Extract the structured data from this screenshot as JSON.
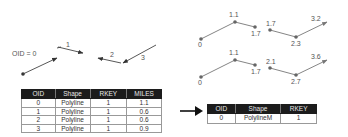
{
  "left_figure": {
    "oid_label": "OID = 0",
    "segment_labels": [
      "1",
      "2",
      "3"
    ]
  },
  "right_figure": {
    "top_line": {
      "measures": [
        "0",
        "1.1",
        "1.7",
        "1.7",
        "2.3",
        "3.2"
      ]
    },
    "bottom_line": {
      "measures": [
        "0",
        "1.1",
        "1.7",
        "2.1",
        "2.7",
        "3.6"
      ]
    }
  },
  "input_table": {
    "columns": [
      "OID",
      "Shape",
      "RKEY",
      "MILES"
    ],
    "rows": [
      [
        "0",
        "Polyline",
        "1",
        "1.1"
      ],
      [
        "1",
        "Polyline",
        "1",
        "0.6"
      ],
      [
        "2",
        "Polyline",
        "1",
        "0.6"
      ],
      [
        "3",
        "Polyline",
        "1",
        "0.9"
      ]
    ]
  },
  "output_table": {
    "columns": [
      "OID",
      "Shape",
      "RKEY"
    ],
    "rows": [
      [
        "0",
        "PolylineM",
        "1"
      ]
    ]
  },
  "colors": {
    "line": "#555555",
    "header_bg": "#1c1c1c",
    "header_text": "#e8e8e8"
  }
}
